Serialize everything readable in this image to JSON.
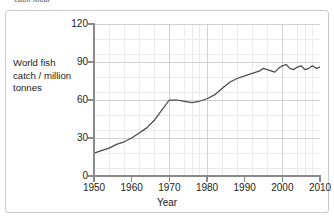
{
  "caption_fragment": "each local",
  "axis_label_lines": [
    "World fish",
    "catch / million",
    "tonnes"
  ],
  "xtitle": "Year",
  "yticks": [
    "0",
    "30",
    "60",
    "90",
    "120"
  ],
  "xticks": [
    "1950",
    "1960",
    "1970",
    "1980",
    "1990",
    "2000",
    "2010"
  ],
  "colors": {
    "line": "#4a4a4a",
    "axis": "#8a8a8a",
    "grid_major": "#cfcfd6",
    "grid_minor": "#e9e9ef",
    "frame": "#c9c9c9",
    "text": "#1b1b1b"
  },
  "chart_data": {
    "type": "line",
    "title": "",
    "xlabel": "Year",
    "ylabel": "World fish catch / million tonnes",
    "xlim": [
      1950,
      2010
    ],
    "ylim": [
      0,
      120
    ],
    "ytick_values": [
      0,
      30,
      60,
      90,
      120
    ],
    "xtick_values": [
      1950,
      1960,
      1970,
      1980,
      1990,
      2000,
      2010
    ],
    "grid": "major and minor",
    "legend": "none",
    "series": [
      {
        "name": "World fish catch",
        "units": "million tonnes",
        "x": [
          1950,
          1952,
          1954,
          1956,
          1958,
          1960,
          1962,
          1964,
          1966,
          1968,
          1970,
          1972,
          1974,
          1976,
          1978,
          1980,
          1982,
          1984,
          1986,
          1988,
          1990,
          1992,
          1994,
          1995,
          1996,
          1997,
          1998,
          1999,
          2000,
          2001,
          2002,
          2003,
          2004,
          2005,
          2006,
          2007,
          2008,
          2009,
          2010
        ],
        "values": [
          18,
          20,
          22,
          25,
          27,
          30,
          34,
          38,
          44,
          52,
          60,
          60,
          59,
          58,
          59,
          61,
          64,
          69,
          74,
          77,
          79,
          81,
          83,
          85,
          84,
          83,
          82,
          85,
          87,
          88,
          85,
          84,
          86,
          87,
          84,
          85,
          87,
          85,
          86
        ]
      }
    ]
  }
}
